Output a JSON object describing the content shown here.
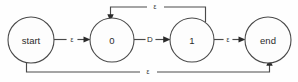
{
  "diagram": {
    "type": "finite-state-machine",
    "title": "",
    "colors": {
      "background": "#fefefe",
      "node_fill": "#fdfdfd",
      "stroke": "#4a4a4a",
      "arrow": "#2b2b2b",
      "text": "#2b2b2b"
    },
    "nodes": [
      {
        "id": "start",
        "label": "start",
        "cx": 31,
        "cy": 40,
        "r": 23
      },
      {
        "id": "zero",
        "label": "0",
        "cx": 112,
        "cy": 40,
        "r": 22
      },
      {
        "id": "one",
        "label": "1",
        "cx": 192,
        "cy": 40,
        "r": 22
      },
      {
        "id": "end",
        "label": "end",
        "cx": 268,
        "cy": 40,
        "r": 23
      }
    ],
    "edges": [
      {
        "id": "start-to-zero",
        "from": "start",
        "to": "zero",
        "label": "ε",
        "label_x": 72,
        "label_y": 39,
        "shape": "straight"
      },
      {
        "id": "zero-to-one",
        "from": "zero",
        "to": "one",
        "label": "D",
        "label_x": 150,
        "label_y": 39,
        "shape": "straight"
      },
      {
        "id": "one-to-end",
        "from": "one",
        "to": "end",
        "label": "ε",
        "label_x": 228,
        "label_y": 39,
        "shape": "straight"
      },
      {
        "id": "one-to-zero-loopback",
        "from": "one",
        "to": "zero",
        "label": "ε",
        "label_x": 155,
        "label_y": 6,
        "shape": "top-feedback"
      },
      {
        "id": "start-to-end-bypass",
        "from": "start",
        "to": "end",
        "label": "ε",
        "label_x": 148,
        "label_y": 71,
        "shape": "bottom-bypass"
      }
    ]
  }
}
